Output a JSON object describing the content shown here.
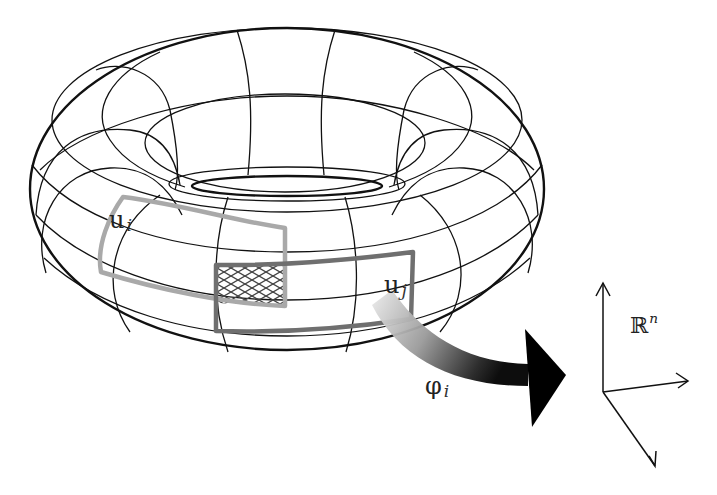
{
  "figure": {
    "labels": {
      "chart_i_base": "u",
      "chart_i_sub": "i",
      "chart_j_base": "u",
      "chart_j_sub": "j",
      "map_base": "φ",
      "map_sub": "i",
      "space_base": "ℝ",
      "space_sup": "n"
    },
    "colors": {
      "wireframe": "#111111",
      "chart_i": "#a9a9a9",
      "chart_j": "#6f6f6f",
      "overlap_hatch": "#444444",
      "arrow_start": "#d8d8d8",
      "arrow_end": "#000000",
      "background": "#ffffff"
    }
  }
}
